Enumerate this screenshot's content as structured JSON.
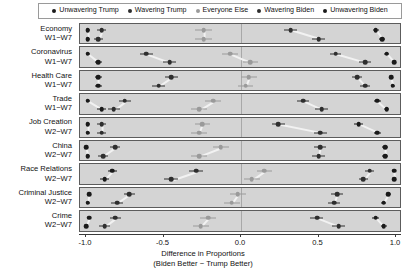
{
  "legend": {
    "position": "top",
    "items": [
      {
        "label": "Unwavering Trump",
        "color": "#1a1a1a"
      },
      {
        "label": "Wavering Trump",
        "color": "#2e2e2e"
      },
      {
        "label": "Everyone Else",
        "color": "#9a9a9a"
      },
      {
        "label": "Wavering Biden",
        "color": "#2e2e2e"
      },
      {
        "label": "Unwavering Biden",
        "color": "#1a1a1a"
      }
    ]
  },
  "axis": {
    "x_ticks": [
      "-1.0",
      "-0.5",
      "0.0",
      "0.5",
      "1.0"
    ],
    "x_tick_values": [
      -1.0,
      -0.5,
      0.0,
      0.5,
      1.0
    ],
    "xlabel_line1": "Difference in Proportions",
    "xlabel_line2": "(Biden Better − Trump Better)",
    "xlim": [
      -1.0,
      1.0
    ]
  },
  "chart_data": {
    "type": "scatter",
    "title": "",
    "xlabel": "Difference in Proportions (Biden Better − Trump Better)",
    "ylabel": "",
    "xlim": [
      -1.0,
      1.0
    ],
    "grid": false,
    "legend_position": "top",
    "series": [
      {
        "name": "Unwavering Trump",
        "color": "#1a1a1a"
      },
      {
        "name": "Wavering Trump",
        "color": "#2e2e2e"
      },
      {
        "name": "Everyone Else",
        "color": "#9a9a9a"
      },
      {
        "name": "Wavering Biden",
        "color": "#2e2e2e"
      },
      {
        "name": "Unwavering Biden",
        "color": "#1a1a1a"
      }
    ],
    "panels": [
      {
        "issue": "Economy",
        "waves": "W1−W7",
        "groups": [
          {
            "series": "Unwavering Trump",
            "first": -0.99,
            "last": -0.99,
            "first_err": 0.015,
            "last_err": 0.015
          },
          {
            "series": "Wavering Trump",
            "first": -0.9,
            "last": -0.92,
            "first_err": 0.03,
            "last_err": 0.03
          },
          {
            "series": "Everyone Else",
            "first": -0.24,
            "last": -0.24,
            "first_err": 0.055,
            "last_err": 0.055
          },
          {
            "series": "Wavering Biden",
            "first": 0.32,
            "last": 0.5,
            "first_err": 0.04,
            "last_err": 0.04
          },
          {
            "series": "Unwavering Biden",
            "first": 0.87,
            "last": 0.91,
            "first_err": 0.02,
            "last_err": 0.02
          }
        ]
      },
      {
        "issue": "Coronavirus",
        "waves": "W1−W7",
        "groups": [
          {
            "series": "Unwavering Trump",
            "first": -0.99,
            "last": -0.92,
            "first_err": 0.018,
            "last_err": 0.025
          },
          {
            "series": "Wavering Trump",
            "first": -0.61,
            "last": -0.46,
            "first_err": 0.042,
            "last_err": 0.042
          },
          {
            "series": "Everyone Else",
            "first": -0.07,
            "last": 0.06,
            "first_err": 0.05,
            "last_err": 0.05
          },
          {
            "series": "Wavering Biden",
            "first": 0.61,
            "last": 0.8,
            "first_err": 0.035,
            "last_err": 0.038
          },
          {
            "series": "Unwavering Biden",
            "first": 0.94,
            "last": 0.99,
            "first_err": 0.018,
            "last_err": 0.012
          }
        ]
      },
      {
        "issue": "Health Care",
        "waves": "W1−W7",
        "groups": [
          {
            "series": "Unwavering Trump",
            "first": -0.92,
            "last": -0.92,
            "first_err": 0.022,
            "last_err": 0.022
          },
          {
            "series": "Wavering Trump",
            "first": -0.45,
            "last": -0.53,
            "first_err": 0.042,
            "last_err": 0.042
          },
          {
            "series": "Everyone Else",
            "first": 0.05,
            "last": 0.03,
            "first_err": 0.05,
            "last_err": 0.05
          },
          {
            "series": "Wavering Biden",
            "first": 0.75,
            "last": 0.8,
            "first_err": 0.032,
            "last_err": 0.032
          },
          {
            "series": "Unwavering Biden",
            "first": 0.97,
            "last": 0.98,
            "first_err": 0.013,
            "last_err": 0.013
          }
        ]
      },
      {
        "issue": "Trade",
        "waves": "W1−W7",
        "groups": [
          {
            "series": "Unwavering Trump",
            "first": -0.99,
            "last": -0.9,
            "first_err": 0.015,
            "last_err": 0.028
          },
          {
            "series": "Wavering Trump",
            "first": -0.75,
            "last": -0.82,
            "first_err": 0.038,
            "last_err": 0.038
          },
          {
            "series": "Everyone Else",
            "first": -0.18,
            "last": -0.27,
            "first_err": 0.052,
            "last_err": 0.052
          },
          {
            "series": "Wavering Biden",
            "first": 0.4,
            "last": 0.52,
            "first_err": 0.04,
            "last_err": 0.04
          },
          {
            "series": "Unwavering Biden",
            "first": 0.88,
            "last": 0.94,
            "first_err": 0.022,
            "last_err": 0.018
          }
        ]
      },
      {
        "issue": "Job Creation",
        "waves": "W2−W7",
        "groups": [
          {
            "series": "Unwavering Trump",
            "first": -0.99,
            "last": -0.99,
            "first_err": 0.015,
            "last_err": 0.015
          },
          {
            "series": "Wavering Trump",
            "first": -0.9,
            "last": -0.9,
            "first_err": 0.03,
            "last_err": 0.03
          },
          {
            "series": "Everyone Else",
            "first": -0.25,
            "last": -0.27,
            "first_err": 0.05,
            "last_err": 0.05
          },
          {
            "series": "Wavering Biden",
            "first": 0.24,
            "last": 0.51,
            "first_err": 0.042,
            "last_err": 0.042
          },
          {
            "series": "Unwavering Biden",
            "first": 0.76,
            "last": 0.88,
            "first_err": 0.028,
            "last_err": 0.022
          }
        ]
      },
      {
        "issue": "China",
        "waves": "W2−W7",
        "groups": [
          {
            "series": "Unwavering Trump",
            "first": -1.0,
            "last": -0.99,
            "first_err": 0.012,
            "last_err": 0.015
          },
          {
            "series": "Wavering Trump",
            "first": -0.81,
            "last": -0.89,
            "first_err": 0.032,
            "last_err": 0.032
          },
          {
            "series": "Everyone Else",
            "first": -0.13,
            "last": -0.27,
            "first_err": 0.052,
            "last_err": 0.052
          },
          {
            "series": "Wavering Biden",
            "first": 0.51,
            "last": 0.5,
            "first_err": 0.04,
            "last_err": 0.04
          },
          {
            "series": "Unwavering Biden",
            "first": 0.93,
            "last": 0.93,
            "first_err": 0.018,
            "last_err": 0.018
          }
        ]
      },
      {
        "issue": "Race Relations",
        "waves": "W2−W7",
        "groups": [
          {
            "series": "Unwavering Trump",
            "first": -0.83,
            "last": -0.88,
            "first_err": 0.03,
            "last_err": 0.03
          },
          {
            "series": "Wavering Trump",
            "first": -0.29,
            "last": -0.45,
            "first_err": 0.045,
            "last_err": 0.045
          },
          {
            "series": "Everyone Else",
            "first": 0.15,
            "last": 0.07,
            "first_err": 0.05,
            "last_err": 0.05
          },
          {
            "series": "Wavering Biden",
            "first": 0.83,
            "last": 0.79,
            "first_err": 0.03,
            "last_err": 0.03
          },
          {
            "series": "Unwavering Biden",
            "first": 0.99,
            "last": 0.99,
            "first_err": 0.01,
            "last_err": 0.01
          }
        ]
      },
      {
        "issue": "Criminal Justice",
        "waves": "W2−W7",
        "groups": [
          {
            "series": "Unwavering Trump",
            "first": -0.98,
            "last": -0.99,
            "first_err": 0.015,
            "last_err": 0.015
          },
          {
            "series": "Wavering Trump",
            "first": -0.72,
            "last": -0.8,
            "first_err": 0.038,
            "last_err": 0.038
          },
          {
            "series": "Everyone Else",
            "first": -0.02,
            "last": -0.06,
            "first_err": 0.052,
            "last_err": 0.052
          },
          {
            "series": "Wavering Biden",
            "first": 0.62,
            "last": 0.6,
            "first_err": 0.038,
            "last_err": 0.038
          },
          {
            "series": "Unwavering Biden",
            "first": 0.95,
            "last": 0.92,
            "first_err": 0.016,
            "last_err": 0.016
          }
        ]
      },
      {
        "issue": "Crime",
        "waves": "W2−W7",
        "groups": [
          {
            "series": "Unwavering Trump",
            "first": -0.98,
            "last": -1.0,
            "first_err": 0.015,
            "last_err": 0.012
          },
          {
            "series": "Wavering Trump",
            "first": -0.81,
            "last": -0.88,
            "first_err": 0.034,
            "last_err": 0.034
          },
          {
            "series": "Everyone Else",
            "first": -0.21,
            "last": -0.26,
            "first_err": 0.052,
            "last_err": 0.052
          },
          {
            "series": "Wavering Biden",
            "first": 0.49,
            "last": 0.63,
            "first_err": 0.042,
            "last_err": 0.042
          },
          {
            "series": "Unwavering Biden",
            "first": 0.87,
            "last": 0.92,
            "first_err": 0.022,
            "last_err": 0.02
          }
        ]
      }
    ]
  }
}
